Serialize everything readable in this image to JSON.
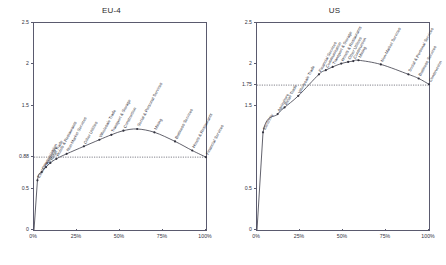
{
  "figure": {
    "background": "#ffffff",
    "line_color": "#3a3a46",
    "axis_color": "#5a5a6e",
    "refline_color": "#4a4a58"
  },
  "panels": [
    {
      "id": "eu",
      "title": "EU-4",
      "chart_data": {
        "type": "line",
        "title": "EU-4",
        "xlabel": "",
        "ylabel": "",
        "xlim": [
          0,
          100
        ],
        "ylim": [
          0,
          2.5
        ],
        "grid": false,
        "legend": "none",
        "xticks": [
          0,
          25,
          50,
          75,
          100
        ],
        "xticklabels": [
          "0%",
          "25%",
          "50%",
          "75%",
          "100%"
        ],
        "yticks": [
          0,
          0.5,
          0.88,
          1.5,
          2,
          2.5
        ],
        "yticklabels": [
          "0",
          "0.5",
          "0.88",
          "1.5",
          "2",
          "2.5"
        ],
        "reference_line": {
          "y": 0.88,
          "label": "0.88",
          "style": "dotted"
        },
        "points": [
          {
            "x": 0,
            "y": 0.0,
            "label": ""
          },
          {
            "x": 2.0,
            "y": 0.6,
            "label": "Electricity"
          },
          {
            "x": 4.5,
            "y": 0.7,
            "label": "Communication"
          },
          {
            "x": 7.0,
            "y": 0.76,
            "label": "Agriculture"
          },
          {
            "x": 9.5,
            "y": 0.81,
            "label": "Retail Trade"
          },
          {
            "x": 13.0,
            "y": 0.86,
            "label": "Hotels & Restaurants"
          },
          {
            "x": 19.0,
            "y": 0.92,
            "label": "Non-Market Services"
          },
          {
            "x": 29.0,
            "y": 1.01,
            "label": "Other Utilities"
          },
          {
            "x": 38.0,
            "y": 1.09,
            "label": "Wholesale Trade"
          },
          {
            "x": 45.0,
            "y": 1.15,
            "label": "Transport & Storage"
          },
          {
            "x": 52.0,
            "y": 1.2,
            "label": "Construction"
          },
          {
            "x": 60.0,
            "y": 1.22,
            "label": "Social & Personal Services"
          },
          {
            "x": 70.0,
            "y": 1.18,
            "label": "Mining"
          },
          {
            "x": 82.0,
            "y": 1.07,
            "label": "Business Services"
          },
          {
            "x": 92.0,
            "y": 0.96,
            "label": "Hotels & Restaurants"
          },
          {
            "x": 100.0,
            "y": 0.88,
            "label": "Financial Services"
          }
        ]
      }
    },
    {
      "id": "us",
      "title": "US",
      "chart_data": {
        "type": "line",
        "title": "US",
        "xlabel": "",
        "ylabel": "",
        "xlim": [
          0,
          100
        ],
        "ylim": [
          0,
          2.5
        ],
        "grid": false,
        "legend": "none",
        "xticks": [
          0,
          25,
          50,
          75,
          100
        ],
        "xticklabels": [
          "0%",
          "25%",
          "50%",
          "75%",
          "100%"
        ],
        "yticks": [
          0,
          0.5,
          1.5,
          1.75,
          2,
          2.5
        ],
        "yticklabels": [
          "0",
          "0.5",
          "1.5",
          "1.75",
          "2",
          "2.5"
        ],
        "reference_line": {
          "y": 1.75,
          "label": "1.75",
          "style": "dotted"
        },
        "points": [
          {
            "x": 0,
            "y": 0.0,
            "label": ""
          },
          {
            "x": 3.5,
            "y": 1.18,
            "label": "Electricity"
          },
          {
            "x": 12.0,
            "y": 1.4,
            "label": "Agriculture"
          },
          {
            "x": 16.0,
            "y": 1.48,
            "label": "Retail Trade"
          },
          {
            "x": 24.0,
            "y": 1.62,
            "label": "Wholesale Trade"
          },
          {
            "x": 36.0,
            "y": 1.88,
            "label": "Financial Services"
          },
          {
            "x": 40.0,
            "y": 1.93,
            "label": "Communication"
          },
          {
            "x": 44.0,
            "y": 1.97,
            "label": "Transport & Storage"
          },
          {
            "x": 49.0,
            "y": 2.01,
            "label": "Hotels & Restaurants"
          },
          {
            "x": 53.0,
            "y": 2.03,
            "label": "Other Utilities"
          },
          {
            "x": 56.0,
            "y": 2.04,
            "label": "Construction"
          },
          {
            "x": 59.0,
            "y": 2.05,
            "label": "Mining"
          },
          {
            "x": 72.0,
            "y": 2.0,
            "label": "Non-Market Services"
          },
          {
            "x": 88.0,
            "y": 1.88,
            "label": "Social & Personal Services"
          },
          {
            "x": 94.0,
            "y": 1.83,
            "label": "Business Services"
          },
          {
            "x": 100.0,
            "y": 1.76,
            "label": "Construction"
          }
        ]
      }
    }
  ]
}
